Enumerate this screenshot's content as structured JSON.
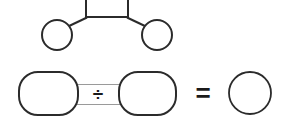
{
  "diagram": {
    "background_color": "#ffffff",
    "stroke_color": "#2b2b2b",
    "band_color": "#9a9a9a",
    "width": 290,
    "height": 126,
    "top_row": {
      "name": "square-with-two-circles",
      "square": {
        "label": "square",
        "x": 86,
        "y": -12,
        "width": 42,
        "height": 29,
        "clipped_top": true
      },
      "left_circle": {
        "label": "circle",
        "cx": 57,
        "cy": 35,
        "r": 15
      },
      "right_circle": {
        "label": "circle",
        "cx": 157,
        "cy": 35,
        "r": 15
      },
      "connectors": [
        {
          "label": "diagonal-left",
          "x1": 86,
          "y1": 17,
          "x2": 69,
          "y2": 26
        },
        {
          "label": "diagonal-right",
          "x1": 128,
          "y1": 17,
          "x2": 145,
          "y2": 26
        },
        {
          "label": "square-bottom-edge",
          "x1": 86,
          "y1": 17,
          "x2": 128,
          "y2": 17
        }
      ]
    },
    "bottom_row": {
      "name": "rounded-rect-division-equals-circle",
      "left_rect": {
        "label": "rounded rectangle",
        "x": 19,
        "y": 72,
        "width": 59,
        "height": 43,
        "rx": 19
      },
      "right_rect": {
        "label": "rounded rectangle",
        "x": 119,
        "y": 72,
        "width": 57,
        "height": 43,
        "rx": 19
      },
      "band": {
        "label": "connector band",
        "x": 74,
        "y": 84,
        "width": 49,
        "height": 21
      },
      "result_circle": {
        "label": "circle",
        "cx": 250,
        "cy": 93,
        "r": 21
      }
    },
    "operators": {
      "divide": {
        "symbol": "÷",
        "x": 98,
        "y": 94
      },
      "equals": {
        "symbol": "=",
        "x": 203,
        "y": 93
      }
    }
  }
}
